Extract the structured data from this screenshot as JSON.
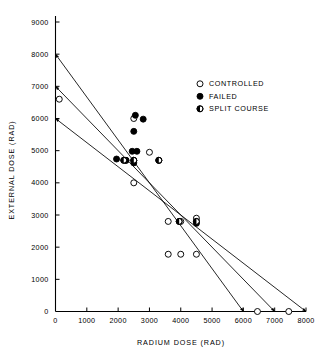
{
  "chart_data": {
    "type": "scatter",
    "title": "",
    "xlabel": "RADIUM DOSE (RAD)",
    "ylabel": "EXTERNAL DOSE (RAD)",
    "xlim": [
      0,
      8000
    ],
    "ylim": [
      0,
      9000
    ],
    "xticks": [
      0,
      1000,
      2000,
      3000,
      4000,
      5000,
      6000,
      7000,
      8000
    ],
    "xtick_labels": [
      "0",
      "1000",
      "2000",
      "3000",
      "4000",
      "5000",
      "6000",
      "7000",
      "8000"
    ],
    "yticks": [
      0,
      1000,
      2000,
      3000,
      4000,
      5000,
      6000,
      7000,
      8000,
      9000
    ],
    "ytick_labels": [
      "0",
      "1000",
      "2000",
      "3000",
      "4000",
      "5000",
      "6000",
      "7000",
      "8000",
      "9000"
    ],
    "grid": false,
    "legend_position": "upper right",
    "series": [
      {
        "name": "CONTROLLED",
        "marker": "open-circle",
        "points": [
          [
            120,
            6600
          ],
          [
            2500,
            6000
          ],
          [
            2250,
            4700
          ],
          [
            2500,
            4700
          ],
          [
            2500,
            4000
          ],
          [
            3000,
            4950
          ],
          [
            3300,
            4700
          ],
          [
            3600,
            2800
          ],
          [
            4000,
            2800
          ],
          [
            4500,
            2900
          ],
          [
            3600,
            1780
          ],
          [
            4000,
            1780
          ],
          [
            4500,
            1780
          ],
          [
            6450,
            0
          ],
          [
            7450,
            0
          ]
        ]
      },
      {
        "name": "FAILED",
        "marker": "filled-circle",
        "points": [
          [
            2550,
            6100
          ],
          [
            2800,
            5980
          ],
          [
            2500,
            5600
          ],
          [
            2450,
            4980
          ],
          [
            2600,
            4980
          ],
          [
            1950,
            4740
          ],
          [
            2250,
            4700
          ],
          [
            2500,
            4620
          ],
          [
            4500,
            2740
          ]
        ]
      },
      {
        "name": "SPLIT COURSE",
        "marker": "half-filled-circle",
        "points": [
          [
            2180,
            4700
          ],
          [
            2500,
            4700
          ],
          [
            3300,
            4700
          ],
          [
            3950,
            2800
          ],
          [
            4500,
            2800
          ]
        ]
      }
    ],
    "reference_lines": [
      {
        "from": [
          0,
          8000
        ],
        "to": [
          6000,
          0
        ],
        "arrow_both_ends": true
      },
      {
        "from": [
          0,
          7000
        ],
        "to": [
          7000,
          0
        ],
        "arrow_both_ends": true
      },
      {
        "from": [
          0,
          6000
        ],
        "to": [
          8000,
          0
        ],
        "arrow_both_ends": true
      }
    ]
  },
  "legend": {
    "entries": [
      {
        "label": "CONTROLLED",
        "marker": "open-circle"
      },
      {
        "label": "FAILED",
        "marker": "filled-circle"
      },
      {
        "label": "SPLIT COURSE",
        "marker": "half-filled-circle"
      }
    ]
  }
}
